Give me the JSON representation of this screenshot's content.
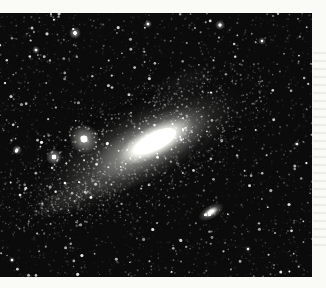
{
  "meta": {
    "visible_text": []
  },
  "page": {
    "width": 326,
    "height": 288,
    "paper_color": "#fafaf7"
  },
  "photo": {
    "x": 0,
    "y": 13,
    "width": 312,
    "height": 264,
    "sky_color": "#0b0b0b",
    "coord_note": "all object coordinates below are photo-local pixels"
  },
  "starfield": {
    "seed": 1337,
    "grain": {
      "count": 2600,
      "alpha": 0.07
    },
    "faint_stars": {
      "count": 2100,
      "size_min": 0.4,
      "size_max": 1.1,
      "alpha_min": 0.08,
      "alpha_max": 0.7
    },
    "medium_stars": {
      "count": 170,
      "size_min": 0.8,
      "size_max": 1.6,
      "alpha_min": 0.55,
      "alpha_max": 1.0
    }
  },
  "galaxy": {
    "name": "andromeda-galaxy-m31",
    "cx": 138,
    "cy": 137,
    "angle_deg": -27,
    "layers": [
      {
        "ox": 0,
        "a": 118,
        "b": 42,
        "color": "#95958f",
        "alpha": 0.2
      },
      {
        "ox": 8,
        "a": 95,
        "b": 34,
        "color": "#a5a5a0",
        "alpha": 0.32
      },
      {
        "ox": 15,
        "a": 66,
        "b": 25,
        "color": "#c2c2bd",
        "alpha": 0.55
      },
      {
        "ox": 20,
        "a": 42,
        "b": 16,
        "color": "#e6e6e1",
        "alpha": 0.82
      },
      {
        "ox": 22,
        "a": 21,
        "b": 9,
        "color": "#ffffff",
        "alpha": 1.0
      },
      {
        "ox": 22,
        "a": 9,
        "b": 5,
        "color": "#ffffff",
        "alpha": 1.0
      }
    ],
    "dust_lanes": [
      {
        "ox": -4,
        "oy": 12,
        "a": 72,
        "b": 22,
        "from": 0.1,
        "to": 0.9,
        "alpha": 0.3,
        "width": 5
      },
      {
        "ox": 0,
        "oy": -16,
        "a": 95,
        "b": 30,
        "from": 1.1,
        "to": 1.9,
        "alpha": 0.22,
        "width": 5
      }
    ],
    "speckle_halo": {
      "count": 950,
      "a": 108,
      "b": 42,
      "jitter": 7,
      "size_min": 0.4,
      "size_max": 1.1,
      "alpha_min": 0.08,
      "alpha_max": 0.5
    }
  },
  "arm_patches": [
    {
      "cx": 96,
      "cy": 172,
      "a": 56,
      "b": 19,
      "angle_deg": -26,
      "color": "#8d8d88",
      "alpha": 0.15,
      "speckles": 160
    },
    {
      "cx": 63,
      "cy": 189,
      "a": 32,
      "b": 12,
      "angle_deg": -22,
      "color": "#8d8d88",
      "alpha": 0.11,
      "speckles": 110
    },
    {
      "cx": 182,
      "cy": 72,
      "a": 38,
      "b": 16,
      "angle_deg": -27,
      "color": "#8d8d88",
      "alpha": 0.09,
      "speckles": 90
    }
  ],
  "companions": [
    {
      "name": "companion-galaxy-m32",
      "cx": 84,
      "cy": 126,
      "core_r": 3.2,
      "glow_r": 15
    },
    {
      "name": "companion-galaxy-ngc205",
      "cx": 211,
      "cy": 199,
      "angle_deg": -30,
      "layers": [
        {
          "a": 14,
          "b": 7,
          "color": "#d8d8d3",
          "alpha": 0.55
        },
        {
          "a": 8,
          "b": 4,
          "color": "#f0f0ea",
          "alpha": 0.8
        },
        {
          "a": 3.2,
          "b": 2.1,
          "color": "#ffffff",
          "alpha": 0.95
        }
      ]
    }
  ],
  "bright_stars": [
    {
      "x": 54,
      "y": 144,
      "r": 2.2,
      "glow": 8,
      "alpha": 1.0
    },
    {
      "x": 75,
      "y": 20,
      "r": 1.7,
      "glow": 6,
      "alpha": 0.95
    },
    {
      "x": 17,
      "y": 137,
      "r": 1.4,
      "glow": 5,
      "alpha": 0.85
    },
    {
      "x": 220,
      "y": 12,
      "r": 1.5,
      "glow": 5,
      "alpha": 0.9
    },
    {
      "x": 148,
      "y": 11,
      "r": 1.3,
      "glow": 4,
      "alpha": 0.85
    },
    {
      "x": 36,
      "y": 37,
      "r": 1.3,
      "glow": 4,
      "alpha": 0.8
    },
    {
      "x": 262,
      "y": 28,
      "r": 1.2,
      "glow": 4,
      "alpha": 0.75
    },
    {
      "x": 297,
      "y": 131,
      "r": 1.1,
      "glow": 3,
      "alpha": 0.7
    },
    {
      "x": 248,
      "y": 236,
      "r": 1.1,
      "glow": 3,
      "alpha": 0.7
    },
    {
      "x": 12,
      "y": 247,
      "r": 1.2,
      "glow": 3,
      "alpha": 0.75
    }
  ]
}
